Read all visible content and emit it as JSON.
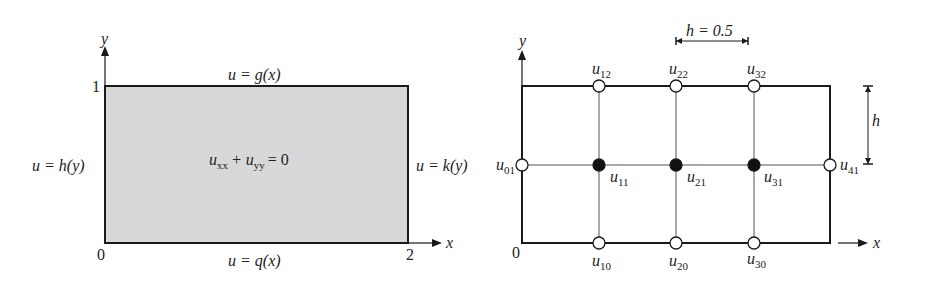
{
  "left_diagram": {
    "domain_fill": "#d8d8d8",
    "equation_main": "u",
    "equation_sub1": "xx",
    "equation_plus": "+ u",
    "equation_sub2": "yy",
    "equation_rhs": "= 0",
    "top_bc": "u = g(x)",
    "bottom_bc": "u = q(x)",
    "left_bc": "u = h(y)",
    "right_bc": "u = k(y)",
    "y_axis_label": "y",
    "x_axis_label": "x",
    "origin_label": "0",
    "y_tick": "1",
    "x_tick": "2"
  },
  "right_diagram": {
    "spacing_label": "h = 0.5",
    "vertical_spacing_label": "h",
    "y_axis_label": "y",
    "x_axis_label": "x",
    "origin_label": "0",
    "nodes": [
      {
        "name": "u",
        "sub": "12",
        "type": "boundary"
      },
      {
        "name": "u",
        "sub": "22",
        "type": "boundary"
      },
      {
        "name": "u",
        "sub": "32",
        "type": "boundary"
      },
      {
        "name": "u",
        "sub": "01",
        "type": "boundary"
      },
      {
        "name": "u",
        "sub": "11",
        "type": "interior"
      },
      {
        "name": "u",
        "sub": "21",
        "type": "interior"
      },
      {
        "name": "u",
        "sub": "31",
        "type": "interior"
      },
      {
        "name": "u",
        "sub": "41",
        "type": "boundary"
      },
      {
        "name": "u",
        "sub": "10",
        "type": "boundary"
      },
      {
        "name": "u",
        "sub": "20",
        "type": "boundary"
      },
      {
        "name": "u",
        "sub": "30",
        "type": "boundary"
      }
    ]
  }
}
